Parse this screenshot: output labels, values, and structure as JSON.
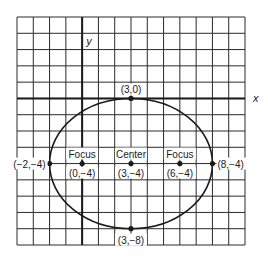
{
  "diagram": {
    "type": "ellipse-on-grid",
    "axes": {
      "x_label": "x",
      "y_label": "y"
    },
    "grid": {
      "x_min": -4,
      "x_max": 10,
      "y_min": -9,
      "y_max": 5,
      "step": 1
    },
    "ellipse": {
      "center": [
        3,
        -4
      ],
      "a": 5,
      "b": 4
    },
    "points": [
      {
        "id": "top",
        "coords": [
          3,
          0
        ],
        "label": "(3,0)"
      },
      {
        "id": "bottom",
        "coords": [
          3,
          -8
        ],
        "label": "(3,−8)"
      },
      {
        "id": "left",
        "coords": [
          -2,
          -4
        ],
        "label": "(−2,−4)"
      },
      {
        "id": "right",
        "coords": [
          8,
          -4
        ],
        "label": "(8,−4)"
      },
      {
        "id": "focus1",
        "coords": [
          0,
          -4
        ],
        "title": "Focus",
        "label": "(0,−4)"
      },
      {
        "id": "center",
        "coords": [
          3,
          -4
        ],
        "title": "Center",
        "label": "(3,−4)"
      },
      {
        "id": "focus2",
        "coords": [
          6,
          -4
        ],
        "title": "Focus",
        "label": "(6,−4)"
      }
    ],
    "colors": {
      "ink": "#1a1a1a",
      "grid": "#2a2a2a",
      "background": "#ffffff"
    }
  }
}
